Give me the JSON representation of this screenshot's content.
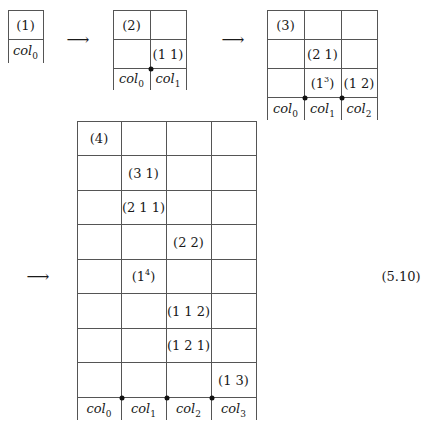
{
  "diagram": {
    "equation_number": "(5.10)",
    "arrow_symbol": "⟶",
    "grids": [
      {
        "id": "grid-1",
        "x": [
          8,
          43
        ],
        "rows_y": [
          10,
          39
        ],
        "bottom_y": 63,
        "dots": [],
        "entries": [
          {
            "col": 0,
            "row": 0,
            "text": "(1)",
            "sup": ""
          }
        ],
        "col_labels": [
          {
            "base": "col",
            "sub": "0"
          }
        ]
      },
      {
        "id": "grid-2",
        "x": [
          113,
          150,
          186
        ],
        "rows_y": [
          10,
          39,
          68
        ],
        "bottom_y": 90,
        "dots": [
          150
        ],
        "entries": [
          {
            "col": 0,
            "row": 0,
            "text": "(2)",
            "sup": ""
          },
          {
            "col": 1,
            "row": 1,
            "text": "(1 1)",
            "sup": ""
          }
        ],
        "col_labels": [
          {
            "base": "col",
            "sub": "0"
          },
          {
            "base": "col",
            "sub": "1"
          }
        ]
      },
      {
        "id": "grid-3",
        "x": [
          267,
          304,
          341,
          377
        ],
        "rows_y": [
          10,
          39,
          68,
          97
        ],
        "bottom_y": 120,
        "dots": [
          304,
          341
        ],
        "entries": [
          {
            "col": 0,
            "row": 0,
            "text": "(3)",
            "sup": ""
          },
          {
            "col": 1,
            "row": 1,
            "text": "(2 1)",
            "sup": ""
          },
          {
            "col": 1,
            "row": 2,
            "text": "(1",
            "sup": "3",
            "close": ")"
          },
          {
            "col": 2,
            "row": 2,
            "text": "(1 2)",
            "sup": ""
          }
        ],
        "col_labels": [
          {
            "base": "col",
            "sub": "0"
          },
          {
            "base": "col",
            "sub": "1"
          },
          {
            "base": "col",
            "sub": "2"
          }
        ]
      },
      {
        "id": "grid-4",
        "x": [
          77,
          121,
          166,
          211,
          256
        ],
        "rows_y": [
          121,
          155,
          190,
          224,
          259,
          293,
          328,
          362,
          397
        ],
        "bottom_y": 420,
        "dots": [
          121,
          166,
          211
        ],
        "entries": [
          {
            "col": 0,
            "row": 0,
            "text": "(4)",
            "sup": ""
          },
          {
            "col": 1,
            "row": 1,
            "text": "(3 1)",
            "sup": ""
          },
          {
            "col": 1,
            "row": 2,
            "text": "(2 1 1)",
            "sup": ""
          },
          {
            "col": 2,
            "row": 3,
            "text": "(2 2)",
            "sup": ""
          },
          {
            "col": 1,
            "row": 4,
            "text": "(1",
            "sup": "4",
            "close": ")"
          },
          {
            "col": 2,
            "row": 5,
            "text": "(1 1 2)",
            "sup": ""
          },
          {
            "col": 2,
            "row": 6,
            "text": "(1 2 1)",
            "sup": ""
          },
          {
            "col": 3,
            "row": 7,
            "text": "(1 3)",
            "sup": ""
          }
        ],
        "col_labels": [
          {
            "base": "col",
            "sub": "0"
          },
          {
            "base": "col",
            "sub": "1"
          },
          {
            "base": "col",
            "sub": "2"
          },
          {
            "base": "col",
            "sub": "3"
          }
        ]
      }
    ],
    "arrows": [
      {
        "x": 78,
        "y": 39
      },
      {
        "x": 233,
        "y": 39
      },
      {
        "x": 38,
        "y": 276
      }
    ],
    "equation_pos": {
      "x": 401,
      "y": 276
    }
  }
}
